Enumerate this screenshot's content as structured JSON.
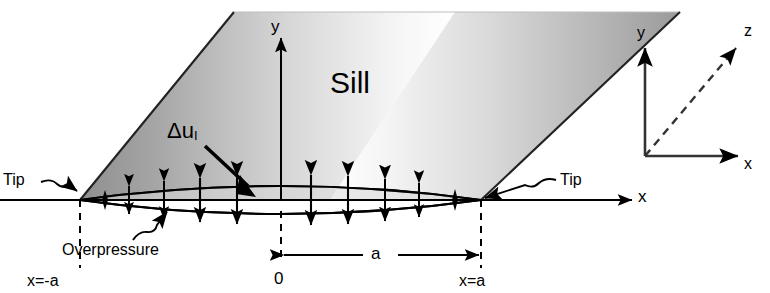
{
  "figure": {
    "labels": {
      "sill": "Sill",
      "y_axis": "y",
      "x_axis": "x",
      "opening_displacement": "Δu",
      "opening_displacement_sub": "I",
      "tip_left": "Tip",
      "tip_right": "Tip",
      "overpressure": "Overpressure",
      "x_minus_a": "x=-a",
      "origin": "0",
      "half_length": "a",
      "x_equals_a": "x=a"
    },
    "triad": {
      "y": "y",
      "x": "x",
      "z": "z"
    },
    "colors": {
      "stroke": "#000000",
      "background": "#ffffff",
      "sill_gray_dark": "#8a8a8a",
      "sill_gray_mid": "#b8b8b8",
      "sill_gray_light": "#f2f2f2"
    },
    "geometry": {
      "origin_x": 281,
      "axis_y": 200,
      "tip_left_x": 80,
      "tip_right_x": 481,
      "lens_half_height": 22,
      "arrow_count_per_side": 5
    }
  }
}
